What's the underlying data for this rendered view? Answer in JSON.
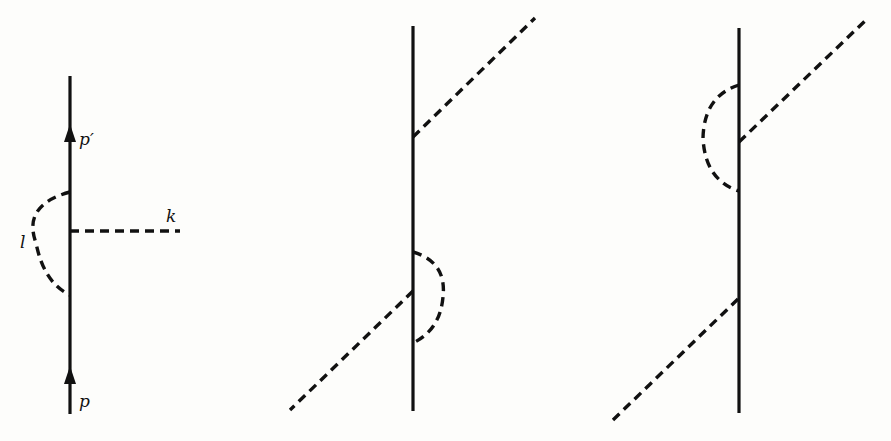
{
  "figure": {
    "type": "feynman-diagrams",
    "panels": [
      {
        "name": "vertex-correction",
        "labels": {
          "incoming": "p",
          "outgoing": "p′",
          "loop": "l",
          "external": "k"
        }
      },
      {
        "name": "external-leg-correction-lower"
      },
      {
        "name": "external-leg-correction-upper"
      }
    ]
  }
}
